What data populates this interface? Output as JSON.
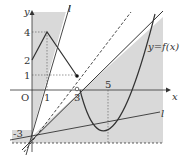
{
  "diagram": {
    "title": "",
    "colors": {
      "shade": "#d9d9d9",
      "line": "#333333",
      "background": "#ffffff"
    },
    "axes": {
      "x_label": "x",
      "y_label": "y",
      "origin_label": "O",
      "x_ticks": [
        "1",
        "3",
        "5"
      ],
      "y_ticks": [
        "4",
        "2",
        "1",
        "-3"
      ]
    },
    "curve_label": "y=f(x)",
    "line_labels": [
      "l",
      "l"
    ]
  }
}
